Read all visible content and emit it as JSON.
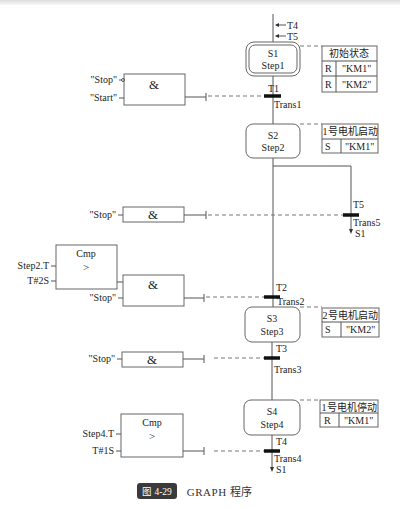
{
  "header": {
    "cropped_text_line": "(cropped, illegible body text)"
  },
  "steps": [
    {
      "id": "S1",
      "name": "Step1",
      "initial": true,
      "incoming": [
        "T4",
        "T5"
      ],
      "action_table": {
        "title": "初始状态",
        "rows": [
          {
            "qual": "R",
            "operand": "\"KM1\""
          },
          {
            "qual": "R",
            "operand": "\"KM2\""
          }
        ]
      }
    },
    {
      "id": "S2",
      "name": "Step2",
      "action_table": {
        "title": "1号电机启动",
        "rows": [
          {
            "qual": "S",
            "operand": "\"KM1\""
          }
        ]
      }
    },
    {
      "id": "S3",
      "name": "Step3",
      "action_table": {
        "title": "2号电机启动",
        "rows": [
          {
            "qual": "S",
            "operand": "\"KM2\""
          }
        ]
      }
    },
    {
      "id": "S4",
      "name": "Step4",
      "action_table": {
        "title": "1号电机停动",
        "rows": [
          {
            "qual": "R",
            "operand": "\"KM1\""
          }
        ]
      }
    }
  ],
  "transitions": [
    {
      "id": "T1",
      "name": "Trans1",
      "logic": {
        "type": "&",
        "inputs": [
          "\"Stop\"",
          "\"Start\""
        ]
      }
    },
    {
      "id": "T5",
      "name": "Trans5",
      "jump_to": "S1",
      "logic": {
        "type": "&",
        "inputs": [
          "\"Stop\""
        ]
      }
    },
    {
      "id": "T2",
      "name": "Trans2",
      "logic": {
        "type": "&",
        "inputs": [
          "\"Stop\""
        ],
        "cmp": {
          "title": "Cmp",
          "op": ">",
          "inputs": [
            "Step2.T",
            "T#2S"
          ]
        }
      }
    },
    {
      "id": "T3",
      "name": "Trans3",
      "logic": {
        "type": "&",
        "inputs": [
          "\"Stop\""
        ]
      }
    },
    {
      "id": "T4",
      "name": "Trans4",
      "jump_to": "S1",
      "logic": {
        "cmp": {
          "title": "Cmp",
          "op": ">",
          "inputs": [
            "Step4.T",
            "T#1S"
          ]
        }
      }
    }
  ],
  "caption": {
    "figure_no": "图 4-29",
    "title": "GRAPH 程序"
  }
}
